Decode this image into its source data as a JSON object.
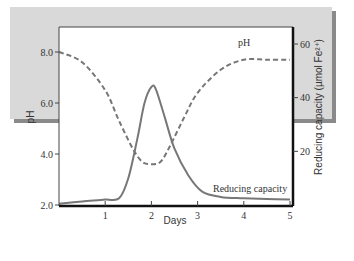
{
  "chart_data": {
    "type": "line",
    "title": "",
    "xlabel": "Days",
    "ylabel": "pH",
    "ylabel_right": "Reducing capacity (µmol Fe²⁺)",
    "xlim": [
      0,
      5
    ],
    "ylim": [
      2.0,
      9.0
    ],
    "ylim_right": [
      0,
      68
    ],
    "x_ticks": [
      "1",
      "2",
      "3",
      "4",
      "5"
    ],
    "y_ticks": [
      "2.0",
      "4.0",
      "6.0",
      "8.0"
    ],
    "y_ticks_right": [
      "20",
      "40",
      "60"
    ],
    "grid": false,
    "legend": "inline annotations",
    "annotations": [
      "pH",
      "Reducing capacity"
    ],
    "series": [
      {
        "name": "pH",
        "axis": "left",
        "style": "dashed",
        "x": [
          0,
          0.5,
          1.0,
          1.3,
          1.6,
          1.8,
          2.0,
          2.2,
          2.4,
          2.7,
          3.0,
          3.5,
          4.0,
          4.5,
          5.0
        ],
        "values": [
          8.0,
          7.6,
          6.5,
          5.3,
          4.2,
          3.7,
          3.6,
          3.7,
          4.3,
          5.4,
          6.4,
          7.3,
          7.7,
          7.7,
          7.7
        ]
      },
      {
        "name": "Reducing capacity",
        "axis": "right",
        "style": "solid",
        "x": [
          0,
          0.5,
          1.0,
          1.3,
          1.5,
          1.7,
          1.85,
          2.0,
          2.1,
          2.3,
          2.5,
          2.8,
          3.1,
          3.5,
          4.0,
          4.5,
          5.0
        ],
        "values": [
          0.5,
          1.3,
          2.0,
          2.5,
          10,
          25,
          38,
          44,
          43,
          32,
          21,
          11,
          5,
          3,
          2.5,
          2.2,
          2.0
        ]
      }
    ]
  },
  "labels": {
    "x_axis_title": "Days",
    "y_axis_title": "pH",
    "y2_axis_title": "Reducing capacity (µmol Fe²⁺)",
    "ph_annotation": "pH",
    "rc_annotation": "Reducing capacity",
    "x_ticks": [
      "1",
      "2",
      "3",
      "4",
      "5"
    ],
    "y_ticks": [
      "2.0",
      "4.0",
      "6.0",
      "8.0"
    ],
    "y2_ticks": [
      "20",
      "40",
      "60"
    ]
  },
  "colors": {
    "panel_bg": "#d9d9d9",
    "panel_shadow": "#8a8a8a",
    "plot_bg": "#ffffff",
    "axis": "#222222",
    "series_line": "#777777"
  }
}
